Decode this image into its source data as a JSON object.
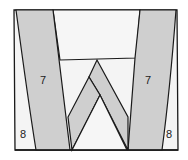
{
  "diagram": {
    "type": "pattern-piece-layout",
    "colors": {
      "outline": "#1a1a1a",
      "fill_light": "#f4f4f4",
      "fill_gray": "#cfcfcf",
      "background": "#ffffff"
    },
    "pieces": [
      {
        "id": "left-strip",
        "label": "7",
        "fill": "gray"
      },
      {
        "id": "right-strip",
        "label": "7",
        "fill": "gray"
      },
      {
        "id": "left-edge-piece",
        "label": "8",
        "fill": "light"
      },
      {
        "id": "right-edge-piece",
        "label": "8",
        "fill": "light"
      },
      {
        "id": "top-panel",
        "label": "",
        "fill": "light"
      },
      {
        "id": "v-left-band",
        "label": "",
        "fill": "gray"
      },
      {
        "id": "v-right-band",
        "label": "",
        "fill": "gray"
      },
      {
        "id": "center-triangle",
        "label": "",
        "fill": "light"
      }
    ],
    "labels": {
      "left_strip": "7",
      "right_strip": "7",
      "left_edge": "8",
      "right_edge": "8"
    }
  }
}
